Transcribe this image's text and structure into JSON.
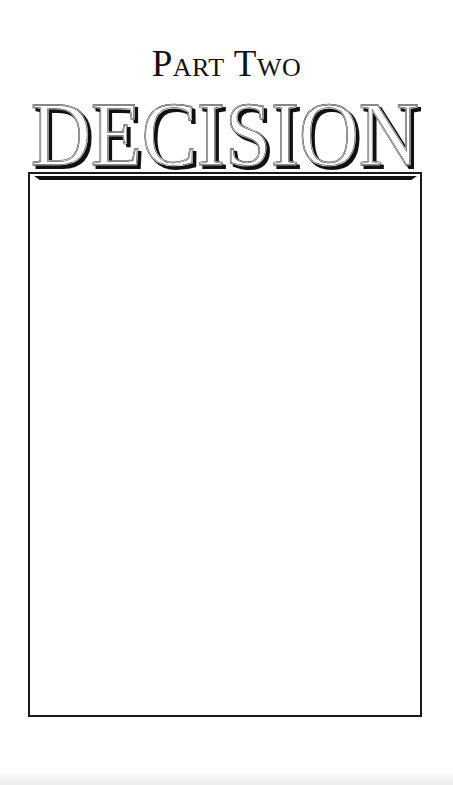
{
  "page": {
    "part_label": "Part Two",
    "title": "DECISION",
    "colors": {
      "background": "#ffffff",
      "ink": "#111111",
      "frame": "#1a1a1a"
    },
    "frame": {
      "content": ""
    }
  }
}
